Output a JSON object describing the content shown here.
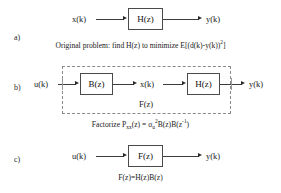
{
  "figure": {
    "background_color": "#ffffff",
    "line_color": "#3c3c3c",
    "dashed_color": "#8a8a8a"
  },
  "panels": {
    "a": {
      "label": "a)",
      "input_label": "x(k)",
      "block_label": "H(z)",
      "output_label": "y(k)",
      "caption_parts": {
        "lead": "Original problem: find H(z) to minimize E[(d(k)-y(k))",
        "exponent": "2",
        "tail": "]"
      }
    },
    "b": {
      "label": "b)",
      "input_label": "u(k)",
      "first_block_label": "B(z)",
      "middle_label": "x(k)",
      "second_block_label": "H(z)",
      "output_label": "y(k)",
      "group_label": "F(z)",
      "caption_parts": {
        "lead": "Factorize P",
        "sub1": "xx",
        "mid1": "(z) = σ",
        "sub2": "u",
        "sup1": "2",
        "mid2": "B(z)B(z",
        "sup2": "-1",
        "tail": ")"
      }
    },
    "c": {
      "label": "c)",
      "input_label": "u(k)",
      "block_label": "F(z)",
      "output_label": "y(k)",
      "caption": "F(z)=H(z)B(z)"
    }
  }
}
